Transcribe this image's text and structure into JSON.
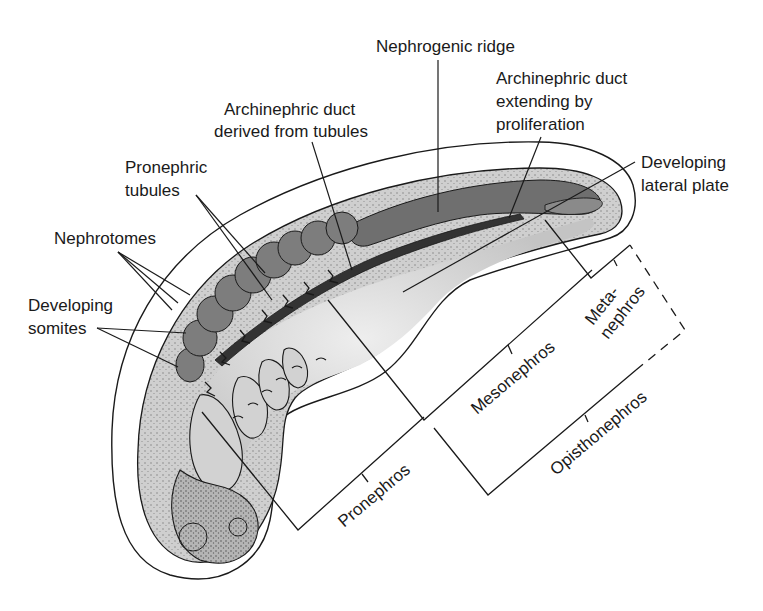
{
  "figure": {
    "colors": {
      "background": "#ffffff",
      "outline": "#1a1a1a",
      "body_fill": "#c9c9c9",
      "body_stipple": "#8a8a8a",
      "somite_fill": "#7d7d7d",
      "ridge_fill": "#6f6f6f",
      "duct_fill": "#3a3a3a",
      "lateral_plate_fill": "#d8d8d8",
      "envelope_fill": "#ffffff"
    }
  },
  "labels": {
    "nephrogenic_ridge": "Nephrogenic ridge",
    "archinephric_duct_tubules_1": "Archinephric duct",
    "archinephric_duct_tubules_2": "derived from tubules",
    "archinephric_duct_proliferation_1": "Archinephric duct",
    "archinephric_duct_proliferation_2": "extending by",
    "archinephric_duct_proliferation_3": "proliferation",
    "pronephric_tubules_1": "Pronephric",
    "pronephric_tubules_2": "tubules",
    "developing_lateral_plate_1": "Developing",
    "developing_lateral_plate_2": "lateral plate",
    "nephrotomes": "Nephrotomes",
    "developing_somites_1": "Developing",
    "developing_somites_2": "somites"
  },
  "regions": {
    "pronephros": "Pronephros",
    "mesonephros": "Mesonephros",
    "metanephros_1": "Meta-",
    "metanephros_2": "nephros",
    "opisthonephros": "Opisthonephros"
  }
}
